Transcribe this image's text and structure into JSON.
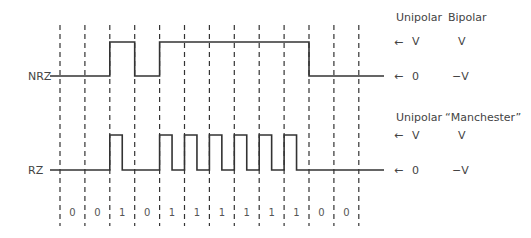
{
  "diagram": {
    "type": "line-coding-waveforms",
    "bits": [
      "0",
      "0",
      "1",
      "0",
      "1",
      "1",
      "1",
      "1",
      "1",
      "1",
      "0",
      "0"
    ],
    "signals": [
      {
        "name": "NRZ",
        "label": "NRZ"
      },
      {
        "name": "RZ",
        "label": "RZ"
      }
    ],
    "nrz_legend": {
      "col1_header": "Unipolar",
      "col2_header": "Bipolar",
      "high_unipolar": "V",
      "high_other": "V",
      "low_unipolar": "0",
      "low_other": "−V"
    },
    "rz_legend": {
      "col1_header": "Unipolar",
      "col2_header": "“Manchester”",
      "high_unipolar": "V",
      "high_other": "V",
      "low_unipolar": "0",
      "low_other": "−V"
    },
    "arrow_icon": "←"
  }
}
